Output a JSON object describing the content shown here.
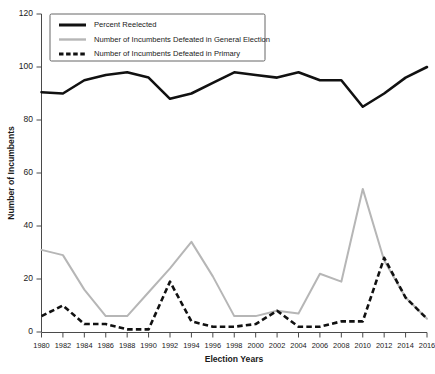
{
  "chart_data": {
    "type": "line",
    "title": "",
    "xlabel": "Election Years",
    "ylabel": "Number of Incumbents",
    "x": [
      1980,
      1982,
      1984,
      1986,
      1988,
      1990,
      1992,
      1994,
      1996,
      1998,
      2000,
      2002,
      2004,
      2006,
      2008,
      2010,
      2012,
      2014,
      2016
    ],
    "xlim": [
      1980,
      2016
    ],
    "ylim": [
      0,
      120
    ],
    "yticks": [
      0,
      20,
      40,
      60,
      80,
      100,
      120
    ],
    "xticks": [
      "1980",
      "1982",
      "1984",
      "1986",
      "1988",
      "1990",
      "1992",
      "1994",
      "1996",
      "1998",
      "2000",
      "2002",
      "2004",
      "2006",
      "2008",
      "2010",
      "2012",
      "2014",
      "2016"
    ],
    "grid": false,
    "legend_position": "top-left",
    "series": [
      {
        "name": "Percent Reelected",
        "style": "solid",
        "color": "#111111",
        "values": [
          90.5,
          90,
          95,
          97,
          98,
          96,
          88,
          90,
          94,
          98,
          97,
          96,
          98,
          95,
          95,
          85,
          90,
          96,
          100
        ]
      },
      {
        "name": "Number of Incumbents Defeated in General Election",
        "style": "solid",
        "color": "#b6b6b6",
        "values": [
          31,
          29,
          16,
          6,
          6,
          15,
          24,
          34,
          21,
          6,
          6,
          8,
          7,
          22,
          19,
          54,
          27,
          13,
          5
        ]
      },
      {
        "name": "Number of Incumbents Defeated in Primary",
        "style": "dashed",
        "color": "#111111",
        "values": [
          6,
          10,
          3,
          3,
          1,
          1,
          19,
          4,
          2,
          2,
          3,
          8,
          2,
          2,
          4,
          4,
          28,
          13,
          5
        ]
      }
    ]
  },
  "axes": {
    "y_title": "Number of Incumbents",
    "x_title": "Election Years"
  },
  "legend": {
    "items": [
      {
        "label": "Percent Reelected",
        "swatch": "solid-black-line-icon"
      },
      {
        "label": "Number of Incumbents Defeated in General Election",
        "swatch": "solid-gray-line-icon"
      },
      {
        "label": "Number of Incumbents Defeated in Primary",
        "swatch": "dashed-black-line-icon"
      }
    ]
  },
  "caption": {
    "text": ""
  }
}
